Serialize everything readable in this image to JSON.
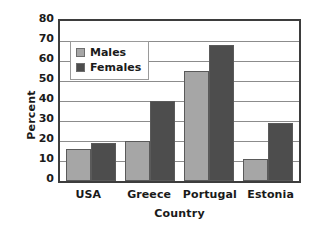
{
  "chart_data": {
    "type": "bar",
    "title": "",
    "subtitle": "",
    "xlabel": "Country",
    "ylabel": "Percent",
    "categories": [
      "USA",
      "Greece",
      "Portugal",
      "Estonia"
    ],
    "series": [
      {
        "name": "Males",
        "color": "#a6a6a6",
        "values": [
          16,
          20,
          55,
          11
        ]
      },
      {
        "name": "Females",
        "color": "#4d4d4d",
        "values": [
          19,
          40,
          68,
          29
        ]
      }
    ],
    "ylim": [
      0,
      80
    ],
    "ytick_values": [
      0,
      10,
      20,
      30,
      40,
      50,
      60,
      70,
      80
    ],
    "ytick_labels": [
      "0",
      "10",
      "20",
      "30",
      "40",
      "50",
      "60",
      "70",
      "80"
    ],
    "grid": true,
    "grid_axis": "y",
    "legend_position": "upper-left-inside",
    "annotations": []
  },
  "axis": {
    "y_title": "Percent",
    "x_title": "Country"
  },
  "legend": {
    "entries": [
      {
        "label": "Males"
      },
      {
        "label": "Females"
      }
    ]
  },
  "colors": {
    "males": "#a6a6a6",
    "females": "#4d4d4d",
    "plot_border": "#3d3d3d",
    "gridline": "#8c8c8c",
    "background": "#ffffff",
    "text": "#1a1a1a"
  }
}
